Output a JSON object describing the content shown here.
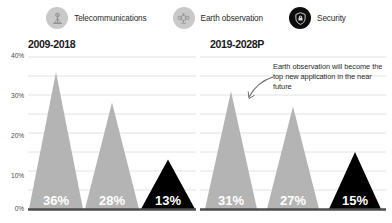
{
  "legend": {
    "items": [
      {
        "label": "Telecommunications",
        "icon": "satellite-dish-icon",
        "swatch": "#c9c9c9",
        "style": "gray"
      },
      {
        "label": "Earth observation",
        "icon": "satellite-icon",
        "swatch": "#c9c9c9",
        "style": "gray"
      },
      {
        "label": "Security",
        "icon": "shield-icon",
        "swatch": "#0d0d0d",
        "style": "dark"
      }
    ]
  },
  "annotation": {
    "text": "Earth observation will become the top new application in the near future"
  },
  "chart_data": [
    {
      "type": "bar",
      "title": "2009-2018",
      "xlabel": "",
      "ylabel": "",
      "ylim": [
        0,
        40
      ],
      "ytick_labels": [
        "0%",
        "10%",
        "20%",
        "30%",
        "40%"
      ],
      "ytick_values": [
        0,
        10,
        20,
        30,
        40
      ],
      "grid": true,
      "grid_step": 5,
      "categories": [
        "Telecommunications",
        "Earth observation",
        "Security"
      ],
      "values": [
        36,
        28,
        13
      ],
      "data_labels": [
        "36%",
        "28%",
        "13%"
      ],
      "colors": [
        "#b4b4b4",
        "#b4b4b4",
        "#000000"
      ]
    },
    {
      "type": "bar",
      "title": "2019-2028P",
      "xlabel": "",
      "ylabel": "",
      "ylim": [
        0,
        40
      ],
      "ytick_labels": [
        "0%",
        "10%",
        "20%",
        "30%",
        "40%"
      ],
      "ytick_values": [
        0,
        10,
        20,
        30,
        40
      ],
      "grid": true,
      "grid_step": 5,
      "categories": [
        "Telecommunications",
        "Earth observation",
        "Security"
      ],
      "values": [
        31,
        27,
        15
      ],
      "data_labels": [
        "31%",
        "27%",
        "15%"
      ],
      "colors": [
        "#b4b4b4",
        "#b4b4b4",
        "#000000"
      ]
    }
  ]
}
